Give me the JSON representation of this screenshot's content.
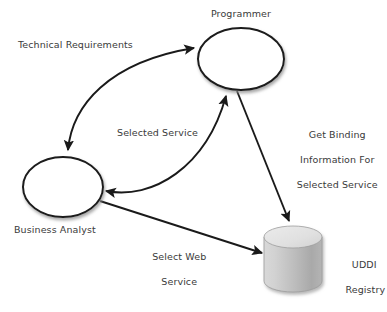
{
  "diagram": {
    "background_color": "#ffffff",
    "stroke_color": "#1a1a1a",
    "text_color": "#3a3a3a",
    "cylinder_top_color": "#e2e2e2",
    "cylinder_body_light": "#cfcfcf",
    "cylinder_body_dark": "#a6a6a6",
    "nodes": [
      {
        "id": "programmer",
        "shape": "ellipse",
        "label": "Programmer",
        "label_position": "above",
        "cx": 241,
        "cy": 59,
        "rx": 43,
        "ry": 31
      },
      {
        "id": "business-analyst",
        "shape": "ellipse",
        "label": "Business Analyst",
        "label_position": "below",
        "cx": 63,
        "cy": 187,
        "rx": 40,
        "ry": 30
      },
      {
        "id": "uddi-registry",
        "shape": "cylinder",
        "label": "UDDI\nRegistry",
        "label_position": "right",
        "cx": 293,
        "cy": 265,
        "rx": 29,
        "height": 62
      }
    ],
    "edges": [
      {
        "id": "technical-requirements",
        "label": "Technical Requirements",
        "from": "business-analyst",
        "to": "programmer",
        "style": "curved",
        "arrowheads": "both"
      },
      {
        "id": "selected-service",
        "label": "Selected Service",
        "from": "programmer",
        "to": "business-analyst",
        "style": "curved",
        "arrowheads": "both"
      },
      {
        "id": "get-binding-information",
        "label": "Get Binding\nInformation For\nSelected Service",
        "from": "programmer",
        "to": "uddi-registry",
        "style": "straight",
        "arrowheads": "end"
      },
      {
        "id": "select-web-service",
        "label": "Select Web\nService",
        "from": "business-analyst",
        "to": "uddi-registry",
        "style": "straight",
        "arrowheads": "end"
      }
    ],
    "labels": {
      "programmer": "Programmer",
      "business_analyst": "Business Analyst",
      "uddi_registry_line1": "UDDI",
      "uddi_registry_line2": "Registry",
      "technical_requirements": "Technical Requirements",
      "selected_service": "Selected Service",
      "get_binding_line1": "Get Binding",
      "get_binding_line2": "Information For",
      "get_binding_line3": "Selected Service",
      "select_web_service_line1": "Select Web",
      "select_web_service_line2": "Service"
    }
  }
}
